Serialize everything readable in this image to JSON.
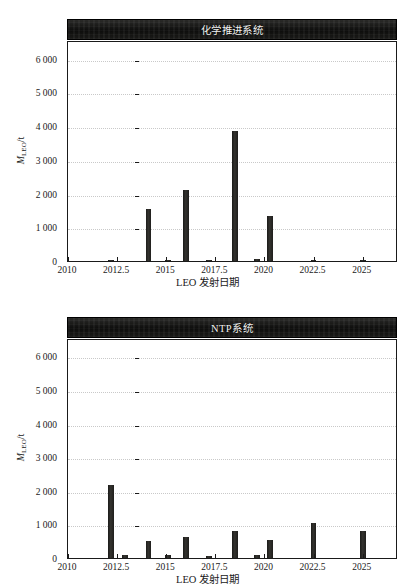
{
  "figure": {
    "panels": [
      {
        "id": "chemical-propulsion",
        "title": "化学推进系统",
        "xlabel": "LEO 发射日期",
        "ylabel_main": "M",
        "ylabel_sub": "LEO",
        "ylabel_unit": "/t"
      },
      {
        "id": "ntp",
        "title": "NTP系统",
        "xlabel": "LEO 发射日期",
        "ylabel_main": "M",
        "ylabel_sub": "LEO",
        "ylabel_unit": "/t"
      }
    ],
    "colors": {
      "bar": "#262523",
      "title_band": "#111110",
      "title_text": "#f2f2f0",
      "grid": "#c9c9c9",
      "axis": "#1a1a1a",
      "background": "#ffffff"
    }
  },
  "chart_data": [
    {
      "type": "bar",
      "title": "化学推进系统",
      "xlabel": "LEO 发射日期",
      "ylabel": "M_LEO/t",
      "xlim": [
        2010,
        2026.8
      ],
      "ylim": [
        0,
        6550
      ],
      "xticks": [
        2010,
        2012.5,
        2015,
        2017.5,
        2020,
        2022.5,
        2025
      ],
      "xtick_labels": [
        "2010",
        "2012.5",
        "2015",
        "2017.5",
        "2020",
        "2022.5",
        "2025"
      ],
      "yticks": [
        0,
        1000,
        2000,
        3000,
        4000,
        5000,
        6000
      ],
      "ytick_labels": [
        "0",
        "1 000",
        "2 000",
        "3 000",
        "4 000",
        "5 000",
        "6 000"
      ],
      "grid": true,
      "legend": "none",
      "x": [
        2012.2,
        2014.1,
        2015.1,
        2016.0,
        2017.2,
        2018.5,
        2019.6,
        2020.3,
        2022.5,
        2025.0
      ],
      "values": [
        35,
        1550,
        40,
        2100,
        40,
        3840,
        45,
        1320,
        30,
        30
      ],
      "bar_width_years": 0.3
    },
    {
      "type": "bar",
      "title": "NTP系统",
      "xlabel": "LEO 发射日期",
      "ylabel": "M_LEO/t",
      "xlim": [
        2010,
        2026.8
      ],
      "ylim": [
        0,
        6550
      ],
      "xticks": [
        2010,
        2012.5,
        2015,
        2017.5,
        2020,
        2022.5,
        2025
      ],
      "xtick_labels": [
        "2010",
        "2012.5",
        "2015",
        "2017.5",
        "2020",
        "2022.5",
        "2025"
      ],
      "yticks": [
        0,
        1000,
        2000,
        3000,
        4000,
        5000,
        6000
      ],
      "ytick_labels": [
        "0",
        "1 000",
        "2 000",
        "3 000",
        "4 000",
        "5 000",
        "6 000"
      ],
      "grid": true,
      "legend": "none",
      "x": [
        2012.2,
        2012.9,
        2014.1,
        2015.1,
        2016.0,
        2017.2,
        2018.5,
        2019.6,
        2020.3,
        2022.5,
        2025.0
      ],
      "values": [
        2180,
        90,
        520,
        75,
        620,
        70,
        800,
        80,
        530,
        1040,
        790
      ],
      "bar_width_years": 0.3
    }
  ]
}
